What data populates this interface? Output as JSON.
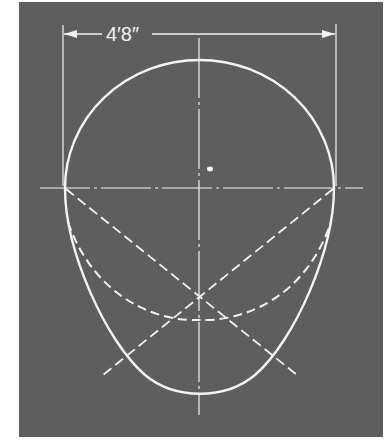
{
  "diagram": {
    "title": "",
    "dimension_label": "4′8″",
    "colors": {
      "background": "#5e5e5e",
      "lines": "#f2f2f2",
      "page": "#ffffff"
    },
    "elements": {
      "dimension_line": "horizontal width dimension with arrows",
      "center_lines": "vertical and horizontal dash-dot center lines",
      "upper_arc": "semicircle top",
      "lower_curve": "solid pointed-egg lower curve",
      "dashed_arc": "dashed construction arc",
      "diagonals": "two dashed diagonal construction lines crossing at lower center",
      "center_dot": "small dot near center"
    }
  }
}
